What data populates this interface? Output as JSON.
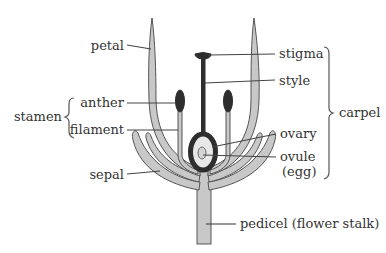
{
  "diagram": {
    "labels": {
      "petal": "petal",
      "stamen": "stamen",
      "anther": "anther",
      "filament": "filament",
      "sepal": "sepal",
      "stigma": "stigma",
      "style": "style",
      "carpel": "carpel",
      "ovary": "ovary",
      "ovule": "ovule",
      "egg": "(egg)",
      "pedicel": "pedicel (flower stalk)"
    },
    "groups": [
      {
        "name": "stamen",
        "members": [
          "anther",
          "filament"
        ]
      },
      {
        "name": "carpel",
        "members": [
          "stigma",
          "style",
          "ovary",
          "ovule"
        ]
      }
    ],
    "colors": {
      "petal_fill": "#c8c8c8",
      "outline": "#555555",
      "carpel_dark": "#2e2e2e",
      "ovary_inner": "#e8e8e8",
      "text": "#333333"
    }
  }
}
